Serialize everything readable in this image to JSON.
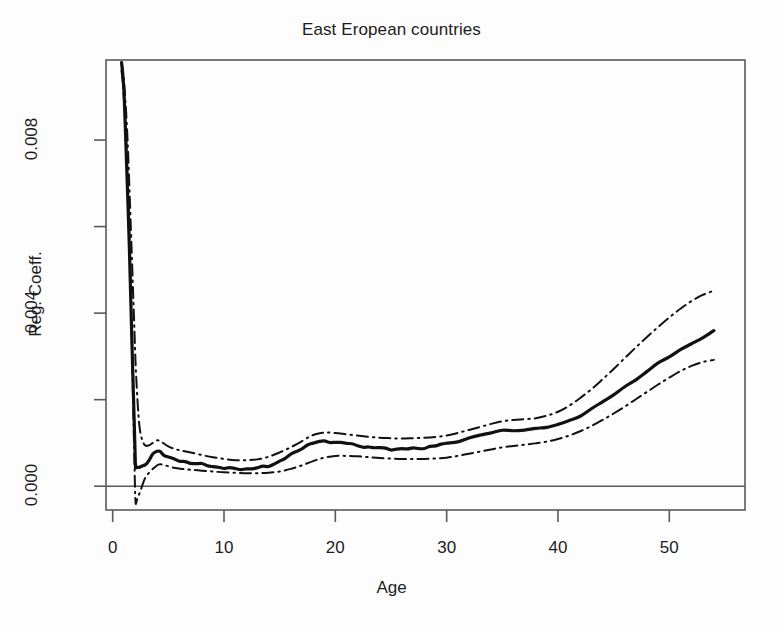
{
  "chart_data": {
    "type": "line",
    "title": "East Eropean countries",
    "xlabel": "Age",
    "ylabel": "Reg. Coeff.",
    "xlim": [
      -0.6,
      56.8
    ],
    "ylim": [
      -0.00055,
      0.00985
    ],
    "grid": false,
    "legend": null,
    "xticks": [
      0,
      10,
      20,
      30,
      40,
      50
    ],
    "xtick_labels": [
      "0",
      "10",
      "20",
      "30",
      "40",
      "50"
    ],
    "yticks": [
      0.0,
      0.002,
      0.004,
      0.006,
      0.008
    ],
    "ytick_labels": [
      "0.000",
      "",
      "0.004",
      "",
      "0.008"
    ],
    "ytick_labels_shown": [
      "0.000",
      "0.004",
      "0.008"
    ],
    "reference_lines": [
      {
        "name": "zero-line",
        "orientation": "horizontal",
        "y": 0.0,
        "style": "solid"
      }
    ],
    "series": [
      {
        "name": "Regression coefficient (fitted)",
        "style": "solid",
        "color": "#111111",
        "width": 3.2,
        "x": [
          0.8,
          1.0,
          1.2,
          1.5,
          1.7,
          1.9,
          2.0,
          2.05,
          2.1,
          2.3,
          2.6,
          3.0,
          3.3,
          3.6,
          3.9,
          4.1,
          4.3,
          4.6,
          5.0,
          5.5,
          6.0,
          6.5,
          7.0,
          7.5,
          8.0,
          8.5,
          9.0,
          9.5,
          10.0,
          10.5,
          11.0,
          11.5,
          12.0,
          12.5,
          13.0,
          13.5,
          14.0,
          14.5,
          15.0,
          15.5,
          16.0,
          16.5,
          17.0,
          17.5,
          18.0,
          18.5,
          19.0,
          19.5,
          20.0,
          20.5,
          21.0,
          21.5,
          22.0,
          22.5,
          23.0,
          23.5,
          24.0,
          24.5,
          25.0,
          25.5,
          26.0,
          26.5,
          27.0,
          27.5,
          28.0,
          28.5,
          29.0,
          29.5,
          30.0,
          31.0,
          32.0,
          33.0,
          34.0,
          35.0,
          36.0,
          37.0,
          38.0,
          39.0,
          40.0,
          41.0,
          42.0,
          43.0,
          44.0,
          45.0,
          46.0,
          47.0,
          48.0,
          49.0,
          50.0,
          51.0,
          52.0,
          53.0,
          54.0
        ],
        "y": [
          0.0098,
          0.0092,
          0.0078,
          0.0055,
          0.0036,
          0.0018,
          0.0009,
          0.00045,
          0.00043,
          0.00044,
          0.00046,
          0.00052,
          0.00062,
          0.00072,
          0.0008,
          0.00082,
          0.0008,
          0.00073,
          0.00066,
          0.00062,
          0.00059,
          0.00057,
          0.00054,
          0.00052,
          0.0005,
          0.00048,
          0.00046,
          0.00044,
          0.00042,
          0.00041,
          0.0004,
          0.0004,
          0.0004,
          0.00041,
          0.00042,
          0.00044,
          0.00047,
          0.00052,
          0.00058,
          0.00065,
          0.00072,
          0.0008,
          0.00088,
          0.00095,
          0.001,
          0.00102,
          0.00103,
          0.00103,
          0.00102,
          0.00101,
          0.00099,
          0.00096,
          0.00094,
          0.00092,
          0.0009,
          0.00089,
          0.00088,
          0.00087,
          0.00086,
          0.00086,
          0.00086,
          0.00086,
          0.00087,
          0.00088,
          0.00089,
          0.00091,
          0.00093,
          0.00096,
          0.00099,
          0.00105,
          0.00111,
          0.00117,
          0.00123,
          0.00128,
          0.0013,
          0.00131,
          0.00132,
          0.00136,
          0.00142,
          0.00152,
          0.00164,
          0.00178,
          0.00194,
          0.00211,
          0.00229,
          0.00248,
          0.00266,
          0.00283,
          0.00299,
          0.00315,
          0.0033,
          0.00345,
          0.00358
        ]
      },
      {
        "name": "Upper confidence band",
        "style": "dashdot",
        "color": "#111111",
        "width": 2.0,
        "x": [
          0.8,
          1.0,
          1.3,
          1.6,
          1.9,
          2.1,
          2.4,
          2.8,
          3.2,
          3.6,
          4.0,
          4.4,
          5.0,
          5.6,
          6.2,
          7.0,
          8.0,
          9.0,
          10.0,
          11.0,
          12.0,
          13.0,
          14.0,
          15.0,
          16.0,
          17.0,
          17.8,
          18.5,
          19.2,
          20.0,
          21.0,
          22.0,
          23.0,
          24.0,
          25.0,
          26.0,
          27.0,
          28.0,
          29.0,
          30.0,
          31.0,
          32.0,
          33.0,
          34.0,
          35.0,
          36.0,
          37.0,
          38.0,
          39.0,
          40.0,
          41.0,
          42.0,
          43.0,
          44.0,
          45.0,
          46.0,
          47.0,
          48.0,
          49.0,
          50.0,
          51.0,
          52.0,
          53.0,
          54.0
        ],
        "y": [
          0.0098,
          0.0094,
          0.0082,
          0.0062,
          0.004,
          0.0026,
          0.0014,
          0.00098,
          0.00094,
          0.001,
          0.00106,
          0.00102,
          0.00092,
          0.00086,
          0.00082,
          0.00078,
          0.00072,
          0.00067,
          0.00063,
          0.0006,
          0.0006,
          0.00062,
          0.00068,
          0.00078,
          0.0009,
          0.00104,
          0.00116,
          0.00122,
          0.00124,
          0.00123,
          0.0012,
          0.00117,
          0.00114,
          0.00112,
          0.00111,
          0.0011,
          0.00111,
          0.00112,
          0.00114,
          0.00117,
          0.00123,
          0.0013,
          0.00137,
          0.00144,
          0.0015,
          0.00153,
          0.00155,
          0.00157,
          0.00163,
          0.00172,
          0.00186,
          0.00204,
          0.00224,
          0.00247,
          0.00271,
          0.00296,
          0.00321,
          0.00345,
          0.00368,
          0.0039,
          0.0041,
          0.00428,
          0.00442,
          0.00452
        ]
      },
      {
        "name": "Lower confidence band",
        "style": "dashdot",
        "color": "#111111",
        "width": 2.0,
        "x": [
          0.8,
          1.0,
          1.3,
          1.6,
          1.8,
          1.95,
          2.05,
          2.2,
          2.5,
          2.9,
          3.3,
          3.7,
          4.1,
          4.5,
          5.0,
          5.6,
          6.2,
          7.0,
          8.0,
          9.0,
          10.0,
          11.0,
          12.0,
          13.0,
          14.0,
          15.0,
          16.0,
          17.0,
          18.0,
          19.0,
          20.0,
          21.0,
          22.0,
          23.0,
          24.0,
          25.0,
          26.0,
          27.0,
          28.0,
          29.0,
          30.0,
          31.0,
          32.0,
          33.0,
          34.0,
          35.0,
          36.0,
          37.0,
          38.0,
          39.0,
          40.0,
          41.0,
          42.0,
          43.0,
          44.0,
          45.0,
          46.0,
          47.0,
          48.0,
          49.0,
          50.0,
          51.0,
          52.0,
          53.0,
          54.0
        ],
        "y": [
          0.0096,
          0.009,
          0.0074,
          0.0048,
          0.0024,
          0.0006,
          -0.00035,
          -0.0003,
          -0.0001,
          0.00018,
          0.00032,
          0.00042,
          0.0005,
          0.0005,
          0.00046,
          0.00042,
          0.0004,
          0.00038,
          0.00036,
          0.00034,
          0.00032,
          0.00031,
          0.0003,
          0.0003,
          0.00031,
          0.00034,
          0.0004,
          0.00048,
          0.00058,
          0.00066,
          0.0007,
          0.0007,
          0.00069,
          0.00067,
          0.00065,
          0.00064,
          0.00063,
          0.00063,
          0.00063,
          0.00064,
          0.00066,
          0.0007,
          0.00075,
          0.0008,
          0.00085,
          0.0009,
          0.00093,
          0.00096,
          0.00099,
          0.00103,
          0.00109,
          0.00117,
          0.00127,
          0.00139,
          0.00153,
          0.00168,
          0.00184,
          0.00201,
          0.00218,
          0.00235,
          0.00251,
          0.00266,
          0.00278,
          0.00287,
          0.00292
        ]
      }
    ]
  },
  "axes": {
    "frame": true,
    "frame_color": "#555555"
  }
}
